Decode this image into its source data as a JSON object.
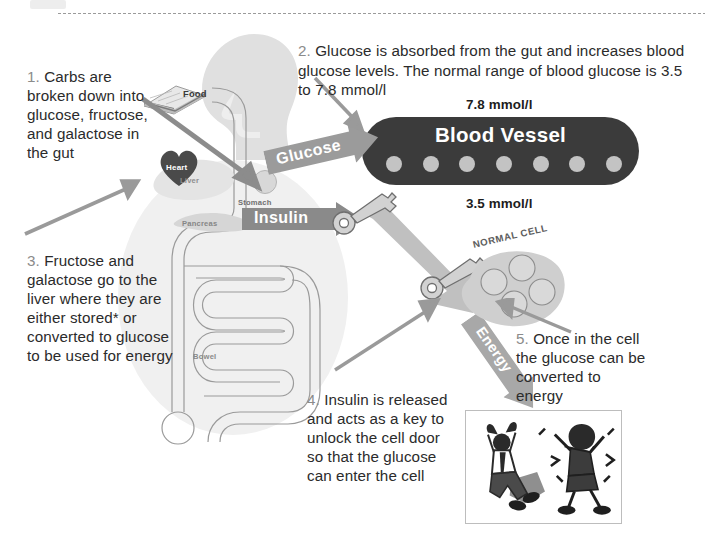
{
  "colors": {
    "vessel_fill": "#3b3b3b",
    "glucose_dot": "#c3c3c3",
    "banner_grey": "#9b9b9b",
    "banner_grey_dark": "#8a8a8a",
    "arrow_grey": "#8c8c8c",
    "body_halo": "#f0f0f0",
    "step_number": "#8b8b8b",
    "body_text": "#2b2b2b",
    "cell_fill": "#cfcfcf",
    "heart_fill": "#4a4a4a",
    "photo_border": "#bdbdbd"
  },
  "steps": {
    "step1": "1. Carbs are broken down into glucose, fructose, and galactose in the gut",
    "step1_number": "1.",
    "step1_body": " Carbs are broken down into glucose, fructose, and galactose in the gut",
    "step2_number": "2.",
    "step2_body": " Glucose is absorbed from the gut and increases blood glucose levels. The normal range of blood glucose is 3.5 to 7.8 mmol/l",
    "step3_number": "3.",
    "step3_body": " Fructose and galactose go to the liver where they are either stored* or converted to glucose to be used for energy",
    "step4_number": "4.",
    "step4_body": " Insulin is released and acts as a key to unlock the cell door so that the glucose can enter the cell",
    "step5_number": "5.",
    "step5_body": " Once in the cell the glucose can be converted to energy"
  },
  "vessel": {
    "title": "Blood Vessel",
    "upper_value": "7.8 mmol/l",
    "lower_value": "3.5 mmol/l",
    "glucose_dot_count": 7
  },
  "banners": {
    "glucose": "Glucose",
    "insulin": "Insulin",
    "energy": "Energy"
  },
  "organs": {
    "food": "Food",
    "heart": "Heart",
    "liver": "Liver",
    "stomach": "Stomach",
    "pancreas": "Pancreas",
    "bowel": "Bowel"
  },
  "cell": {
    "label": "NORMAL CELL",
    "vesicle_count": 4
  },
  "icons": {
    "key1": "key-icon",
    "key2": "key-icon",
    "flow_arrow": "thick-arrow-icon",
    "photo": "celebrating-people-illustration"
  }
}
